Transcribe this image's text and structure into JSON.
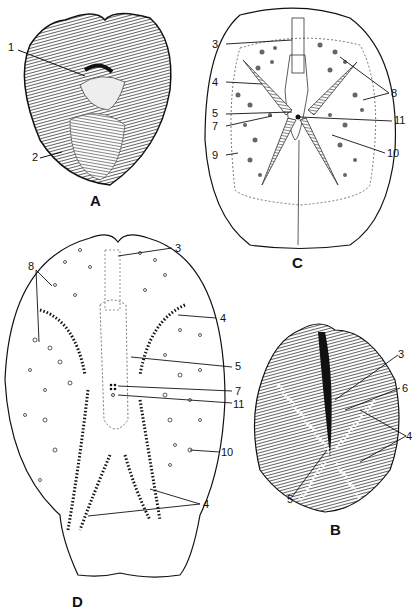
{
  "figures": {
    "A": {
      "label": "A",
      "callouts": [
        "1",
        "2"
      ]
    },
    "B": {
      "label": "B",
      "callouts": [
        "3",
        "6",
        "4",
        "5"
      ]
    },
    "C": {
      "label": "C",
      "callouts": [
        "3",
        "4",
        "5",
        "7",
        "9",
        "8",
        "11",
        "10"
      ]
    },
    "D": {
      "label": "D",
      "callouts": [
        "8",
        "3",
        "4",
        "5",
        "7",
        "11",
        "10",
        "4"
      ]
    }
  },
  "colors": {
    "ink": "#111111",
    "paper": "#ffffff",
    "shade": "#555555"
  }
}
